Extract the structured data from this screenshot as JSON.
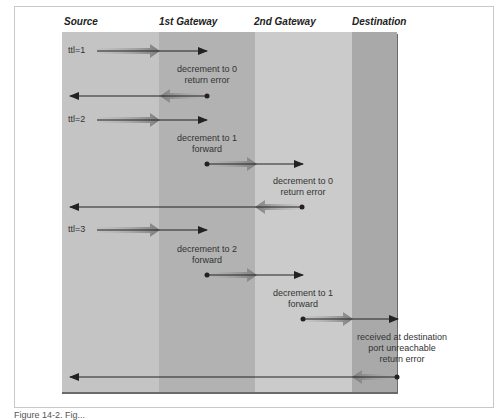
{
  "figure": {
    "columns": [
      "Source",
      "1st Gateway",
      "2nd Gateway",
      "Destination"
    ],
    "colors": {
      "source_band": "#c4c4c4",
      "gateway1_band": "#b0b0b0",
      "gateway2_band": "#cacaca",
      "destination_band": "#a8a8a8",
      "arrow_line": "#222222",
      "fat_arrow": "#8a8a8a"
    },
    "rounds": [
      {
        "ttl_label": "ttl=1",
        "annotations": [
          "decrement to 0",
          "return error"
        ]
      },
      {
        "ttl_label": "ttl=2",
        "annotations": [
          {
            "line1": "decrement to 1",
            "line2": "forward"
          },
          {
            "line1": "decrement to 0",
            "line2": "return error"
          }
        ]
      },
      {
        "ttl_label": "ttl=3",
        "annotations": [
          {
            "line1": "decrement to 2",
            "line2": "forward"
          },
          {
            "line1": "decrement to 1",
            "line2": "forward"
          },
          {
            "line1": "received at destination",
            "line2": "port unreachable",
            "line3": "return error"
          }
        ]
      }
    ],
    "caption": "Figure 14-2. Fig..."
  }
}
